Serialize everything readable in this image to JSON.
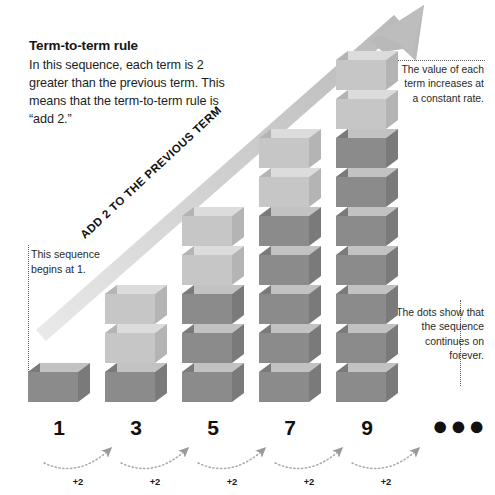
{
  "rule": {
    "title": "Term-to-term rule",
    "body": "In this sequence, each term is 2 greater than the previous term. This means that the term-to-term rule is “add 2.”"
  },
  "diagonal_arrow": {
    "label": "ADD 2 TO THE PREVIOUS TERM",
    "color": "#c9c9c9"
  },
  "callouts": {
    "begin": "This sequence begins at 1.",
    "value": "The value of each term increases at a constant rate.",
    "dots": "The dots show that the sequence continues on forever."
  },
  "ellipsis": "●●●",
  "colors": {
    "cube_light_top": "#dcdcdc",
    "cube_light_front": "#c6c6c6",
    "cube_light_side": "#b4b4b4",
    "cube_dark_top": "#c2c2c2",
    "cube_dark_front": "#8b8b8b",
    "cube_dark_side": "#7a7a7a",
    "dot_leader": "#5d5d5d",
    "text": "#1a1a1a"
  },
  "chart_data": {
    "type": "bar",
    "title": "Term-to-term rule",
    "xlabel": "",
    "ylabel": "",
    "categories": [
      "1",
      "3",
      "5",
      "7",
      "9"
    ],
    "values": [
      1,
      3,
      5,
      7,
      9
    ],
    "new_cubes_per_term": [
      1,
      2,
      2,
      2,
      2
    ],
    "difference": 2,
    "first_term": 1,
    "step_labels": [
      "+2",
      "+2",
      "+2",
      "+2",
      "+2"
    ],
    "continues": true
  },
  "towers": [
    {
      "label": "1",
      "total": 1,
      "light": 0,
      "left": 28
    },
    {
      "label": "3",
      "total": 3,
      "light": 2,
      "left": 105
    },
    {
      "label": "5",
      "total": 5,
      "light": 2,
      "left": 182
    },
    {
      "label": "7",
      "total": 7,
      "light": 2,
      "left": 259
    },
    {
      "label": "9",
      "total": 9,
      "light": 2,
      "left": 336
    }
  ],
  "steps": [
    {
      "label": "+2",
      "x": 78
    },
    {
      "label": "+2",
      "x": 155
    },
    {
      "label": "+2",
      "x": 232
    },
    {
      "label": "+2",
      "x": 309
    },
    {
      "label": "+2",
      "x": 386
    }
  ]
}
